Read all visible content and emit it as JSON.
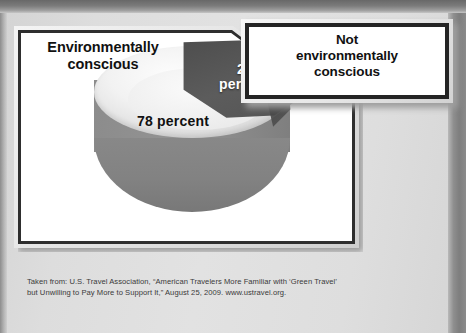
{
  "figure": {
    "left_label": "Environmentally\nconscious",
    "right_label": "Not\nenvironmentally\nconscious",
    "slice_label_small": "22\npercent",
    "slice_label_large": "78 percent"
  },
  "labels": {
    "environmentally_conscious_line1": "Environmentally",
    "environmentally_conscious_line2": "conscious",
    "not_env_line1": "Not",
    "not_env_line2": "environmentally",
    "not_env_line3": "conscious",
    "pct_22_number": "22",
    "pct_22_word": "percent",
    "pct_78": "78 percent"
  },
  "source": {
    "line1": "Taken from: U.S. Travel Association, “American Travelers More Familiar with ‘Green Travel’",
    "line2": "but Unwilling to Pay More to Support It,” August 25, 2009. www.ustravel.org."
  },
  "colors": {
    "slice_dark": "#565656",
    "slice_light": "#e6e6e6",
    "cylinder_side": "#8a8a8a",
    "panel_border": "#2e2e2e",
    "panel_face": "#ffffff",
    "page_background": "#dcdcdc",
    "label_text": "#111111",
    "slice_label_text": "#ffffff",
    "source_text": "#3a3a3a"
  },
  "chart_data": {
    "type": "pie",
    "title": "",
    "categories": [
      "Environmentally conscious",
      "Not environmentally conscious"
    ],
    "values": [
      78,
      22
    ],
    "value_labels": [
      "78 percent",
      "22 percent"
    ],
    "units": "percent",
    "total": 100,
    "legend": "callout-labels",
    "grid": false,
    "three_d": true,
    "exploded": false,
    "slice_colors": [
      "#e6e6e6",
      "#565656"
    ],
    "source": "Taken from: U.S. Travel Association, “American Travelers More Familiar with ‘Green Travel’ but Unwilling to Pay More to Support It,” August 25, 2009. www.ustravel.org."
  }
}
